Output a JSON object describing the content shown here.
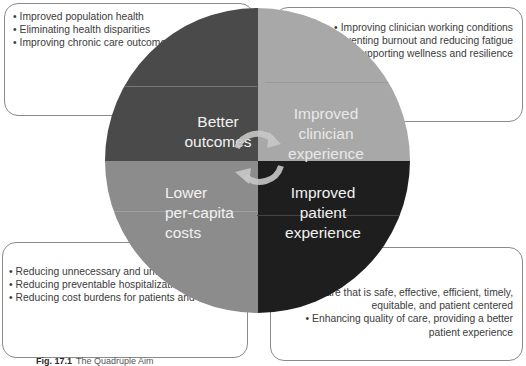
{
  "diagram": {
    "title_caption": {
      "label": "Fig. 17.1",
      "text": "The Quadruple Aim"
    },
    "quadrants": [
      {
        "id": "better-outcomes",
        "label_lines": [
          "Better",
          "outcomes"
        ],
        "color": "#4a4a4a",
        "position": "top-left",
        "bullets": [
          "Improved population health",
          "Eliminating health disparities",
          "Improving chronic care outcomes"
        ]
      },
      {
        "id": "improved-clinician-experience",
        "label_lines": [
          "Improved",
          "clinician",
          "experience"
        ],
        "color": "#a8a8a8",
        "position": "top-right",
        "bullets": [
          "Improving clinician working conditions",
          "Preventing burnout and reducing fatigue",
          "Supporting wellness and resilience"
        ]
      },
      {
        "id": "lower-per-capita-costs",
        "label_lines": [
          "Lower",
          "per-capita",
          "costs"
        ],
        "color": "#8c8c8c",
        "position": "bottom-left",
        "bullets": [
          "Reducing unnecessary and unwarranted care",
          "Reducing preventable hospitalizations",
          "Reducing cost burdens for patients and families"
        ]
      },
      {
        "id": "improved-patient-experience",
        "label_lines": [
          "Improved",
          "patient",
          "experience"
        ],
        "color": "#1e1e1e",
        "position": "bottom-right",
        "bullets": [
          "Care that is safe, effective, efficient, timely, equitable, and patient centered",
          "Enhancing quality of care, providing a better patient experience"
        ]
      }
    ],
    "center_icon": "cycle-arrows-icon"
  }
}
